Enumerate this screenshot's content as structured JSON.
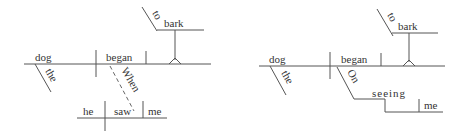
{
  "diagrams": [
    {
      "subject": "dog",
      "subject_modifier": "the",
      "verb": "began",
      "infinitive_prep": "to",
      "infinitive_verb": "bark",
      "adverb_clause_connector": "When",
      "clause_subject": "he",
      "clause_verb": "saw",
      "clause_object": "me"
    },
    {
      "subject": "dog",
      "subject_modifier": "the",
      "verb": "began",
      "infinitive_prep": "to",
      "infinitive_verb": "bark",
      "preposition": "On",
      "gerund": "seeing",
      "gerund_object": "me"
    }
  ]
}
